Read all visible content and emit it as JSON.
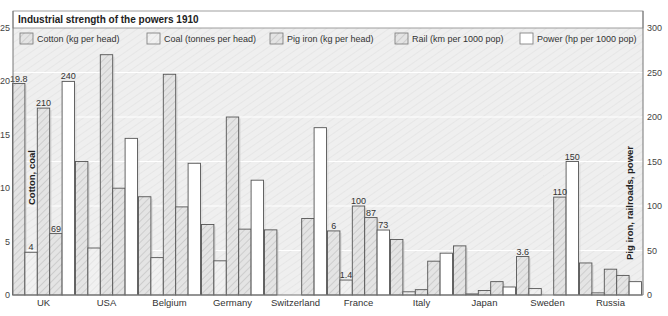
{
  "chart_data": {
    "type": "bar",
    "title": "Industrial strength of the powers 1910",
    "categories": [
      "UK",
      "USA",
      "Belgium",
      "Germany",
      "Switzerland",
      "France",
      "Italy",
      "Japan",
      "Sweden",
      "Russia"
    ],
    "series": [
      {
        "name": "Cotton (kg per head)",
        "axis": "left",
        "fill": "hatch",
        "values": [
          19.8,
          12.5,
          9.2,
          6.6,
          6.1,
          6,
          5.2,
          4.6,
          3.6,
          3.0
        ]
      },
      {
        "name": "Coal (tonnes per head)",
        "axis": "left",
        "fill": "hatch-light",
        "values": [
          4,
          4.4,
          3.5,
          3.2,
          0.0,
          1.4,
          0.3,
          0.1,
          0.6,
          0.2
        ]
      },
      {
        "name": "Pig iron (kg per head)",
        "axis": "right",
        "fill": "hatch",
        "values": [
          210,
          270,
          248,
          200,
          0,
          100,
          6,
          5,
          0,
          29
        ]
      },
      {
        "name": "Rail (km per 1000 pop)",
        "axis": "right",
        "fill": "hatch",
        "values": [
          69,
          120,
          99,
          74,
          86,
          87,
          38,
          15,
          110,
          22
        ]
      },
      {
        "name": "Power (hp per 1000 pop)",
        "axis": "right",
        "fill": "white",
        "values": [
          240,
          176,
          148,
          129,
          188,
          73,
          47,
          9,
          150,
          15
        ]
      }
    ],
    "ylabel": "Cotton, coal",
    "ylabel_right": "Pig iron, railroads, power",
    "ylim": [
      0,
      25
    ],
    "ylim_right": [
      0,
      300
    ],
    "yticks": [
      0,
      5,
      10,
      15,
      20,
      25
    ],
    "yticks_right": [
      0,
      50,
      100,
      150,
      200,
      250,
      300
    ],
    "data_labels": [
      {
        "category": "UK",
        "series": 0,
        "text": "19.8"
      },
      {
        "category": "UK",
        "series": 1,
        "text": "4"
      },
      {
        "category": "UK",
        "series": 2,
        "text": "210"
      },
      {
        "category": "UK",
        "series": 3,
        "text": "69"
      },
      {
        "category": "UK",
        "series": 4,
        "text": "240"
      },
      {
        "category": "France",
        "series": 0,
        "text": "6"
      },
      {
        "category": "France",
        "series": 1,
        "text": "1.4"
      },
      {
        "category": "France",
        "series": 2,
        "text": "100"
      },
      {
        "category": "France",
        "series": 3,
        "text": "87"
      },
      {
        "category": "France",
        "series": 4,
        "text": "73"
      },
      {
        "category": "Sweden",
        "series": 0,
        "text": "3.6"
      },
      {
        "category": "Sweden",
        "series": 3,
        "text": "110"
      },
      {
        "category": "Sweden",
        "series": 4,
        "text": "150"
      }
    ],
    "grid": true,
    "legend_position": "top"
  },
  "colors": {
    "background": "#ececec",
    "hatch_line": "#c8c8c8",
    "bar_stroke": "#555555",
    "bar_fill": "#e2e2e2",
    "bar_fill_light": "#f0f0f0",
    "white": "#ffffff",
    "text": "#333333",
    "grid": "#ffffff"
  }
}
